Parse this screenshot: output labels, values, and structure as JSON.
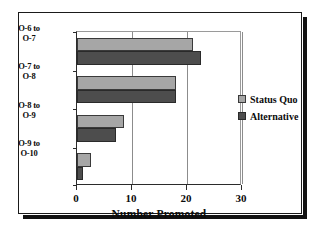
{
  "chart_data": {
    "type": "bar",
    "orientation": "horizontal",
    "title": "",
    "xlabel": "Number Promoted",
    "ylabel": "",
    "xlim": [
      0,
      30
    ],
    "xticks": [
      0,
      10,
      20,
      30
    ],
    "xtick_labels": [
      "0",
      "10",
      "20",
      "30"
    ],
    "grid": true,
    "grid_axis": "x",
    "legend_position": "right",
    "categories": [
      "O-6 to O-7",
      "O-7 to O-8",
      "O-8 to O-9",
      "O-9 to O-10"
    ],
    "category_lines": [
      [
        "O-6 to",
        "O-7"
      ],
      [
        "O-7 to",
        "O-8"
      ],
      [
        "O-8 to",
        "O-9"
      ],
      [
        "O-9 to",
        "O-10"
      ]
    ],
    "series": [
      {
        "name": "Status Quo",
        "color": "#a6a6a6",
        "values": [
          21,
          18,
          8.5,
          2.5
        ]
      },
      {
        "name": "Alternative",
        "color": "#4d4d4d",
        "values": [
          22.5,
          18,
          7,
          1
        ]
      }
    ]
  },
  "legend": {
    "entries": [
      {
        "label": "Status Quo"
      },
      {
        "label": "Alternative"
      }
    ]
  },
  "axis": {
    "x_title": "Number Promoted"
  }
}
